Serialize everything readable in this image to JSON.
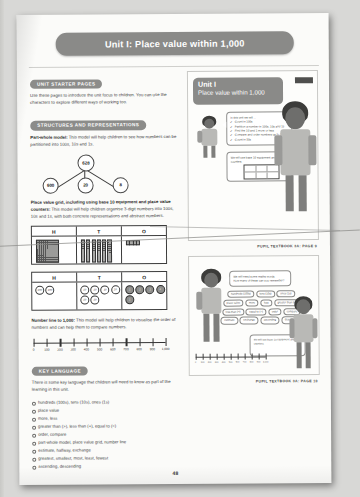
{
  "document": {
    "banner_title": "Unit I: Place value within 1,000",
    "page_number": "48"
  },
  "left_column": {
    "section_starter": {
      "heading": "UNIT STARTER PAGES",
      "body": "Use these pages to introduce the unit focus to children. You can use the characters to explore different ways of working too."
    },
    "section_structures": {
      "heading": "STRUCTURES AND REPRESENTATIONS",
      "part_whole": {
        "lead": "Part-whole model:",
        "body": " This model will help children to see how numbers can be partitioned into 100s, 10s and 1s.",
        "whole": "628",
        "parts": [
          "600",
          "20",
          "8"
        ]
      },
      "place_value_grid": {
        "lead": "Place value grid, including using base 10 equipment and place value counters:",
        "body": " This model will help children organise 3-digit numbers into 100s, 10s and 1s, with both concrete representations and abstract numbers.",
        "columns": [
          "H",
          "T",
          "O"
        ],
        "counter_labels": [
          "100",
          "100",
          "10",
          "10",
          "10",
          "10",
          "10",
          "10",
          "1",
          "1",
          "1",
          "1",
          "1"
        ]
      },
      "number_line": {
        "lead": "Number line to 1,000:",
        "body": " This model will help children to visualise the order of numbers and can help them to compare numbers.",
        "ticks": [
          "0",
          "100",
          "200",
          "300",
          "400",
          "500",
          "600",
          "700",
          "800",
          "900",
          "1,000"
        ]
      }
    },
    "section_key_language": {
      "heading": "KEY LANGUAGE",
      "intro": "There is some key language that children will need to know as part of the learning in this unit.",
      "items": [
        "hundreds (100s), tens (10s), ones (1s)",
        "place value",
        "more, less",
        "greater than (>), less than (<), equal to (=)",
        "order, compare",
        "part-whole model, place value grid, number line",
        "estimate, halfway, exchange",
        "greatest, smallest, most, least, fewest",
        "ascending, descending"
      ]
    }
  },
  "right_column": {
    "textbook_top": {
      "unit_label": "Unit I",
      "unit_subtitle": "Place value within 1,000",
      "bubble_intro": "In this unit we will ...",
      "bubble_items": [
        "Count in 100s",
        "Partition a number in 100s, 10s and 1s",
        "Find the 10 and 1 more or less",
        "Compare and order numbers up to 1,000",
        "Count in 50s"
      ],
      "caption": "PUPIL TEXTBOOK 3A: PAGE 9"
    },
    "textbook_bottom": {
      "bubble_line1": "We will need some maths words.",
      "bubble_line2": "How many of these can you remember?",
      "word_pills": [
        "hundreds (100s)",
        "tens (10s)",
        "ones (1s)",
        "place value",
        "more",
        "less",
        "greater than (>)",
        "less than (<)",
        "equal to (=)",
        "order",
        "compare",
        "estimate",
        "exchange",
        "ascending",
        "descending"
      ],
      "bubble_right": "We will use base 10 equipment and counters.",
      "caption": "PUPIL TEXTBOOK 3A: PAGE 10"
    }
  }
}
